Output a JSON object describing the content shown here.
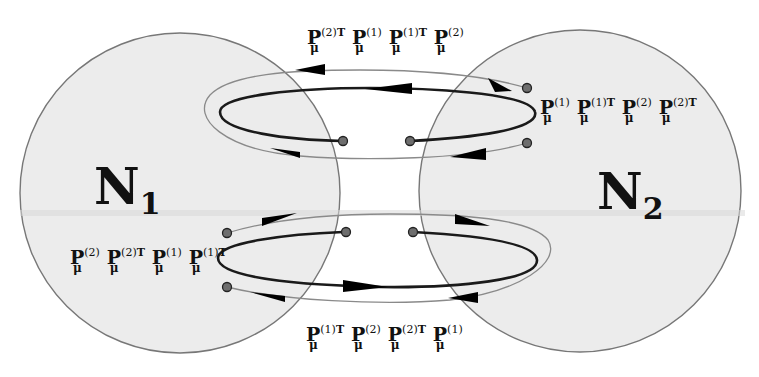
{
  "diagram": {
    "nodes": [
      {
        "id": "N1",
        "label": "N",
        "index": "1",
        "cx": 180,
        "cy": 193,
        "r": 160,
        "fill": "#ececec",
        "stroke": "#777777"
      },
      {
        "id": "N2",
        "label": "N",
        "index": "2",
        "cx": 580,
        "cy": 191,
        "r": 161,
        "fill": "#ececec",
        "stroke": "#777777"
      }
    ],
    "symbols": {
      "P": "P",
      "mu": "μ",
      "T": "T"
    },
    "loops": [
      {
        "position": "upper",
        "inner_path_label": "P_μ^(1) P_μ^(1)T P_μ^(2) P_μ^(2)T",
        "outer_path_label": "P_μ^(2)T P_μ^(1) P_μ^(1)T P_μ^(2)"
      },
      {
        "position": "lower",
        "inner_path_label": "P_μ^(2) P_μ^(2)T P_μ^(1) P_μ^(1)T",
        "outer_path_label": "P_μ^(1)T P_μ^(2) P_μ^(2)T P_μ^(1)"
      }
    ],
    "labels": {
      "top": [
        {
          "sup": "(2)",
          "t": "T"
        },
        {
          "sup": "(1)",
          "t": ""
        },
        {
          "sup": "(1)",
          "t": "T"
        },
        {
          "sup": "(2)",
          "t": ""
        }
      ],
      "right": [
        {
          "sup": "(1)",
          "t": ""
        },
        {
          "sup": "(1)",
          "t": "T"
        },
        {
          "sup": "(2)",
          "t": ""
        },
        {
          "sup": "(2)",
          "t": "T"
        }
      ],
      "left": [
        {
          "sup": "(2)",
          "t": ""
        },
        {
          "sup": "(2)",
          "t": "T"
        },
        {
          "sup": "(1)",
          "t": ""
        },
        {
          "sup": "(1)",
          "t": "T"
        }
      ],
      "bottom": [
        {
          "sup": "(1)",
          "t": "T"
        },
        {
          "sup": "(2)",
          "t": ""
        },
        {
          "sup": "(2)",
          "t": "T"
        },
        {
          "sup": "(1)",
          "t": ""
        }
      ]
    },
    "colors": {
      "circle_fill": "#ececec",
      "circle_stroke": "#777777",
      "inner_loop": "#1a1a1a",
      "outer_loop": "#8a8a8a",
      "arrow": "#000000",
      "dot_fill": "#6e6e6e",
      "dot_stroke": "#222222"
    }
  }
}
